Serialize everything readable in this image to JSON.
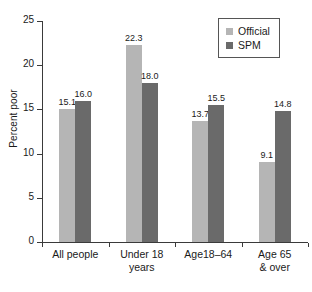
{
  "chart_data": {
    "type": "bar",
    "title": "",
    "xlabel": "",
    "ylabel": "Percent poor",
    "ylim": [
      0,
      25
    ],
    "ytick_values": [
      0,
      5,
      10,
      15,
      20,
      25
    ],
    "ytick_labels": [
      "0",
      "5",
      "10",
      "15",
      "20",
      "25"
    ],
    "grid": false,
    "legend_position": "top-right",
    "categories": [
      "All people",
      "Under 18\nyears",
      "Age18–64",
      "Age 65\n& over"
    ],
    "series": [
      {
        "name": "Official",
        "color": "#b5b5b5",
        "values": [
          15.1,
          22.3,
          13.7,
          9.1
        ],
        "labels": [
          "15.1",
          "22.3",
          "13.7",
          "9.1"
        ]
      },
      {
        "name": "SPM",
        "color": "#6a6a6a",
        "values": [
          16.0,
          18.0,
          15.5,
          14.8
        ],
        "labels": [
          "16.0",
          "18.0",
          "15.5",
          "14.8"
        ]
      }
    ]
  },
  "legend": {
    "entries": [
      {
        "label": "Official",
        "color": "#b5b5b5"
      },
      {
        "label": "SPM",
        "color": "#6a6a6a"
      }
    ]
  },
  "colors": {
    "official": "#b5b5b5",
    "spm": "#6a6a6a",
    "axis": "#3a3a3a",
    "text": "#1a1a1a",
    "background": "#ffffff"
  }
}
